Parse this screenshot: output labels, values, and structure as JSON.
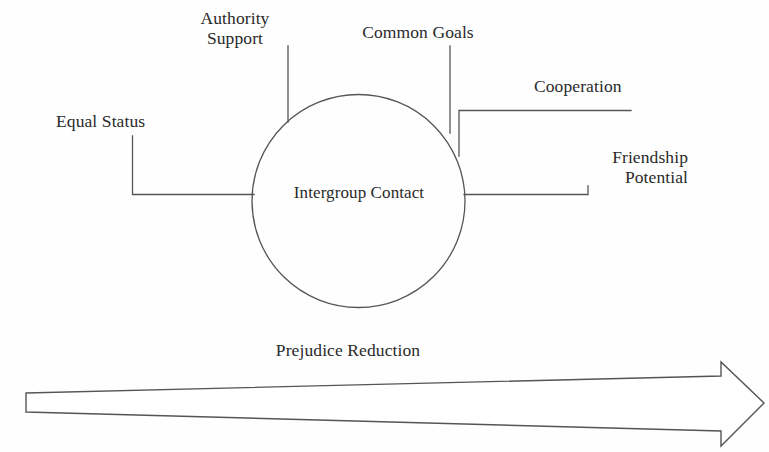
{
  "diagram": {
    "background_color": "#fefefe",
    "line_color": "#555555",
    "text_color": "#2a2a2a",
    "center_node": {
      "label": "Intergroup Contact",
      "shape": "circle"
    },
    "conditions": [
      {
        "id": "equal-status",
        "label": "Equal Status",
        "position": "left"
      },
      {
        "id": "authority-support",
        "label": "Authority\nSupport",
        "position": "top-left"
      },
      {
        "id": "common-goals",
        "label": "Common Goals",
        "position": "top-right"
      },
      {
        "id": "cooperation",
        "label": "Cooperation",
        "position": "right-upper"
      },
      {
        "id": "friendship-potential",
        "label": "Friendship\nPotential",
        "position": "right-lower"
      }
    ],
    "outcome": {
      "label": "Prejudice Reduction",
      "arrow_direction": "right"
    }
  }
}
